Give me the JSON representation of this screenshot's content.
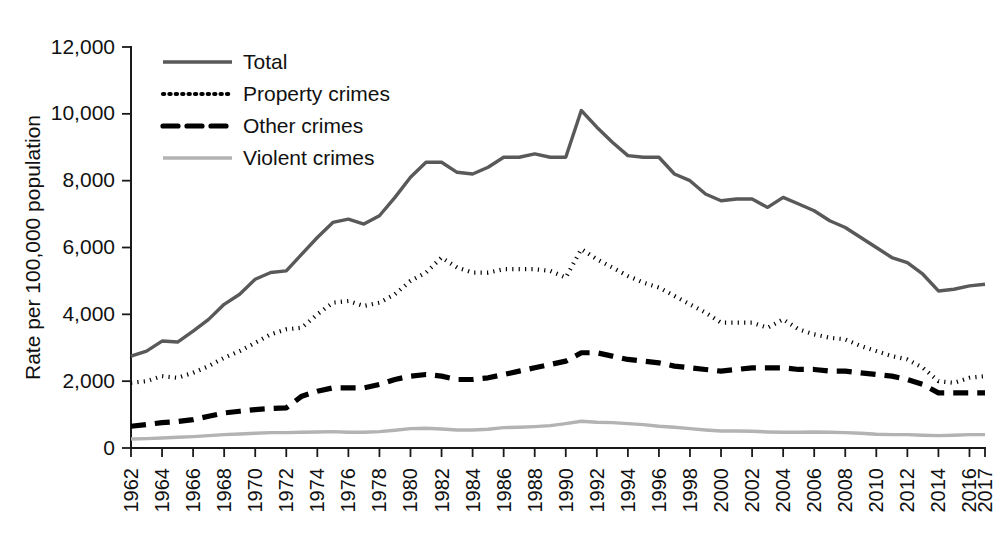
{
  "chart_data": {
    "type": "line",
    "title": "",
    "xlabel": "",
    "ylabel": "Rate per 100,000 population",
    "ylim": [
      0,
      12000
    ],
    "xlim": [
      1962,
      2017
    ],
    "grid": false,
    "legend_position": "top-left",
    "y_ticks": [
      0,
      2000,
      4000,
      6000,
      8000,
      10000,
      12000
    ],
    "y_tick_labels": [
      "0",
      "2,000",
      "4,000",
      "6,000",
      "8,000",
      "10,000",
      "12,000"
    ],
    "x_tick_labels": [
      "1962",
      "1964",
      "1966",
      "1968",
      "1970",
      "1972",
      "1974",
      "1976",
      "1978",
      "1980",
      "1982",
      "1984",
      "1986",
      "1988",
      "1990",
      "1992",
      "1994",
      "1996",
      "1998",
      "2000",
      "2002",
      "2004",
      "2006",
      "2008",
      "2010",
      "2012",
      "2014",
      "2016",
      "2017"
    ],
    "x": [
      1962,
      1963,
      1964,
      1965,
      1966,
      1967,
      1968,
      1969,
      1970,
      1971,
      1972,
      1973,
      1974,
      1975,
      1976,
      1977,
      1978,
      1979,
      1980,
      1981,
      1982,
      1983,
      1984,
      1985,
      1986,
      1987,
      1988,
      1989,
      1990,
      1991,
      1992,
      1993,
      1994,
      1995,
      1996,
      1997,
      1998,
      1999,
      2000,
      2001,
      2002,
      2003,
      2004,
      2005,
      2006,
      2007,
      2008,
      2009,
      2010,
      2011,
      2012,
      2013,
      2014,
      2015,
      2016,
      2017
    ],
    "series": [
      {
        "name": "Total",
        "style": "solid",
        "color": "#595959",
        "values": [
          2750,
          2900,
          3200,
          3170,
          3500,
          3850,
          4300,
          4600,
          5050,
          5250,
          5300,
          5800,
          6300,
          6750,
          6850,
          6700,
          6950,
          7500,
          8100,
          8550,
          8550,
          8250,
          8200,
          8400,
          8700,
          8700,
          8800,
          8700,
          8700,
          10100,
          9600,
          9150,
          8750,
          8700,
          8700,
          8200,
          8000,
          7600,
          7400,
          7450,
          7450,
          7200,
          7500,
          7300,
          7100,
          6800,
          6600,
          6300,
          6000,
          5700,
          5550,
          5200,
          4700,
          4750,
          4850,
          4900
        ],
        "endpoint_values": {
          "1962": 2750,
          "1991": 10100,
          "2017": 4900
        }
      },
      {
        "name": "Property crimes",
        "style": "dotted",
        "color": "#000000",
        "values": [
          1950,
          2000,
          2150,
          2100,
          2250,
          2450,
          2700,
          2900,
          3150,
          3400,
          3550,
          3600,
          4000,
          4350,
          4400,
          4250,
          4350,
          4600,
          5000,
          5250,
          5700,
          5400,
          5250,
          5250,
          5350,
          5350,
          5350,
          5300,
          5100,
          5950,
          5650,
          5400,
          5150,
          4950,
          4800,
          4550,
          4300,
          4050,
          3750,
          3750,
          3750,
          3600,
          3850,
          3550,
          3400,
          3300,
          3250,
          3050,
          2900,
          2750,
          2650,
          2400,
          2000,
          1950,
          2100,
          2150
        ],
        "endpoint_values": {
          "1962": 1950,
          "1982": 5700,
          "1991": 5950,
          "2017": 2150
        }
      },
      {
        "name": "Other crimes",
        "style": "dashed",
        "color": "#000000",
        "values": [
          650,
          700,
          760,
          790,
          850,
          950,
          1050,
          1100,
          1150,
          1180,
          1200,
          1550,
          1700,
          1800,
          1800,
          1800,
          1900,
          2050,
          2150,
          2200,
          2150,
          2050,
          2050,
          2100,
          2200,
          2300,
          2400,
          2500,
          2600,
          2850,
          2850,
          2750,
          2650,
          2600,
          2550,
          2450,
          2400,
          2350,
          2300,
          2350,
          2400,
          2400,
          2400,
          2350,
          2350,
          2300,
          2300,
          2250,
          2200,
          2150,
          2050,
          1900,
          1650,
          1650,
          1650,
          1650
        ],
        "endpoint_values": {
          "1962": 650,
          "1991": 2850,
          "2017": 1650
        }
      },
      {
        "name": "Violent crimes",
        "style": "solid",
        "color": "#b3b3b3",
        "values": [
          270,
          280,
          300,
          320,
          340,
          370,
          400,
          420,
          440,
          460,
          460,
          470,
          480,
          490,
          470,
          470,
          490,
          530,
          580,
          590,
          570,
          540,
          540,
          560,
          610,
          620,
          640,
          670,
          730,
          800,
          770,
          760,
          730,
          700,
          650,
          620,
          580,
          540,
          510,
          510,
          500,
          480,
          470,
          470,
          480,
          470,
          460,
          440,
          410,
          400,
          400,
          380,
          370,
          380,
          400,
          400
        ],
        "endpoint_values": {
          "1962": 270,
          "1991": 800,
          "2017": 400
        }
      }
    ]
  }
}
